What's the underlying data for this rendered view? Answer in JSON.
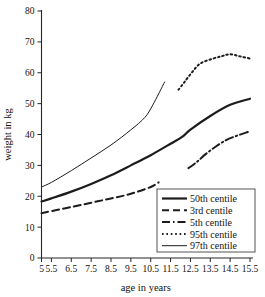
{
  "chart_data": {
    "type": "line",
    "title": "",
    "xlabel": "age in years",
    "ylabel": "weight in kg",
    "xlim": [
      5,
      15.5
    ],
    "ylim": [
      0,
      80
    ],
    "grid": false,
    "legend_position": "bottom-right",
    "xticks": [
      "5",
      "5.5",
      "6.5",
      "7.5",
      "8.5",
      "9.5",
      "10.5",
      "11.5",
      "12.5",
      "13.5",
      "14.5",
      "15.5"
    ],
    "xtick_values": [
      5,
      5.5,
      6.5,
      7.5,
      8.5,
      9.5,
      10.5,
      11.5,
      12.5,
      13.5,
      14.5,
      15.5
    ],
    "yticks": [
      "0",
      "10",
      "20",
      "30",
      "40",
      "50",
      "60",
      "70",
      "80"
    ],
    "ytick_values": [
      0,
      10,
      20,
      30,
      40,
      50,
      60,
      70,
      80
    ],
    "series": [
      {
        "name": "50th centile",
        "style": "solid",
        "stroke_width": 2.2,
        "dash": "none",
        "x": [
          5,
          5.5,
          6.5,
          7.5,
          8.5,
          9.5,
          10.5,
          11.5,
          12.1,
          12.5,
          13.5,
          14.5,
          15.5
        ],
        "values": [
          18.3,
          19.3,
          21.5,
          24.0,
          26.8,
          30.0,
          33.3,
          37.0,
          39.3,
          41.6,
          46.0,
          49.6,
          51.6
        ]
      },
      {
        "name": "3rd centile",
        "style": "dashed",
        "stroke_width": 2.0,
        "dash": "7,4",
        "x": [
          5,
          5.5,
          6.5,
          7.5,
          8.5,
          9.5,
          10.5,
          10.9
        ],
        "values": [
          14.5,
          15.2,
          16.5,
          17.9,
          19.3,
          20.8,
          23.0,
          24.5
        ]
      },
      {
        "name": "5th centile",
        "style": "dash-dot",
        "stroke_width": 2.0,
        "dash": "8,3,1.5,3",
        "x": [
          12.4,
          12.8,
          13.3,
          13.8,
          14.3,
          14.8,
          15.3,
          15.5
        ],
        "values": [
          29.1,
          31.0,
          33.8,
          36.2,
          38.2,
          39.5,
          40.6,
          41.0
        ]
      },
      {
        "name": "95th centile",
        "style": "dotted",
        "stroke_width": 2.0,
        "dash": "1.6,2.8",
        "x": [
          11.9,
          12.2,
          12.6,
          13.0,
          13.6,
          14.1,
          14.5,
          15.0,
          15.5
        ],
        "values": [
          54.5,
          57.0,
          60.3,
          63.0,
          64.5,
          65.4,
          66.0,
          65.3,
          64.6
        ]
      },
      {
        "name": "97th centile",
        "style": "thin-solid",
        "stroke_width": 1.0,
        "dash": "none",
        "x": [
          5,
          5.5,
          6.5,
          7.5,
          8.5,
          9.5,
          10.2,
          10.6,
          11.2
        ],
        "values": [
          23.0,
          24.5,
          28.3,
          32.4,
          36.6,
          41.5,
          45.5,
          49.5,
          57.0
        ]
      }
    ]
  },
  "legend": {
    "entries": [
      {
        "label": "50th centile"
      },
      {
        "label": "3rd centile"
      },
      {
        "label": "5th centile"
      },
      {
        "label": "95th centile"
      },
      {
        "label": "97th centile"
      }
    ]
  },
  "colors": {
    "ink": "#1c1c1c",
    "axis": "#262626",
    "background": "#ffffff",
    "legend_border": "#555555"
  }
}
